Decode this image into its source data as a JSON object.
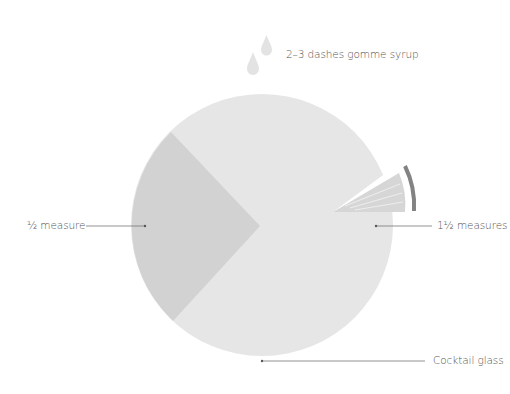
{
  "diagram": {
    "colors": {
      "glass_fill": "#e6e6e6",
      "half_measure_fill": "#d2d2d2",
      "garnish_wedge": "#d6d6d6",
      "garnish_rind": "#838383",
      "drop_fill": "#e3e3e3",
      "leader_line": "#777777",
      "text": "#555555"
    },
    "labels": {
      "syrup": "2–3 dashes gomme syrup",
      "half_measure": "½ measure",
      "one_half_measures": "1½ measures",
      "glass": "Cocktail glass"
    },
    "icons": {
      "drops": "drop-icon",
      "garnish": "citrus-wedge-icon"
    }
  }
}
